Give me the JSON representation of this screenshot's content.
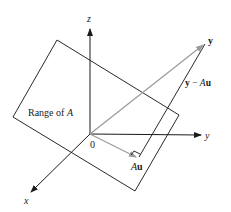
{
  "diagram": {
    "axes": {
      "z_label": "z",
      "y_label": "y",
      "x_label": "x"
    },
    "origin_label": "0",
    "plane_label_prefix": "Range of ",
    "plane_label_matrix": "A",
    "vector_y_label": "y",
    "residual_label_y": "y",
    "residual_label_minus": " − ",
    "residual_label_A": "A",
    "residual_label_u": "u",
    "projection_label_A": "A",
    "projection_label_u": "u",
    "colors": {
      "axis": "#1a1a1a",
      "plane": "#2a2a2a",
      "vector": "#9a9a9a",
      "residual": "#2a2a2a"
    }
  }
}
